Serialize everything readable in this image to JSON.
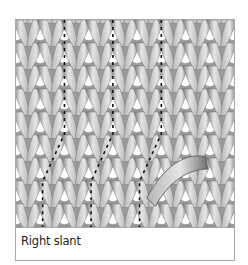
{
  "figure": {
    "caption": "Right slant",
    "stitch_rows": 10,
    "stitch_cols": 9,
    "marked_columns": [
      2,
      4,
      6
    ],
    "colors": {
      "yarn_light": "#e6e6e6",
      "yarn_mid": "#b4b4b4",
      "yarn_dark": "#6e6e6e",
      "border": "#a8a8a8",
      "dash": "#111111"
    }
  }
}
